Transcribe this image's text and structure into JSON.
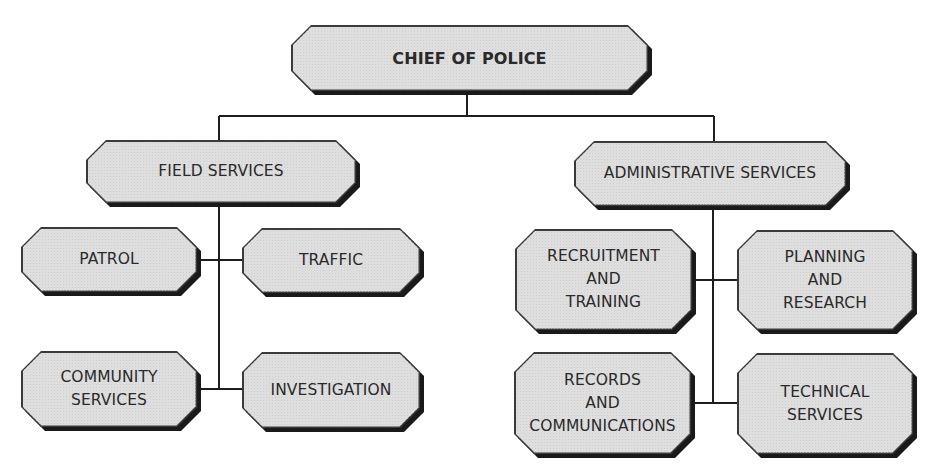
{
  "diagram": {
    "type": "org-chart",
    "root": {
      "label": "CHIEF OF POLICE",
      "children": [
        "field_services",
        "administrative_services"
      ]
    },
    "nodes": {
      "chief": {
        "lines": [
          "CHIEF OF POLICE"
        ]
      },
      "field_services": {
        "lines": [
          "FIELD SERVICES"
        ]
      },
      "administrative_services": {
        "lines": [
          "ADMINISTRATIVE SERVICES"
        ]
      },
      "patrol": {
        "lines": [
          "PATROL"
        ]
      },
      "traffic": {
        "lines": [
          "TRAFFIC"
        ]
      },
      "community_services": {
        "lines": [
          "COMMUNITY",
          "SERVICES"
        ]
      },
      "investigation": {
        "lines": [
          "INVESTIGATION"
        ]
      },
      "recruitment_training": {
        "lines": [
          "RECRUITMENT",
          "AND",
          "TRAINING"
        ]
      },
      "planning_research": {
        "lines": [
          "PLANNING",
          "AND",
          "RESEARCH"
        ]
      },
      "records_communications": {
        "lines": [
          "RECORDS",
          "AND",
          "COMMUNICATIONS"
        ]
      },
      "technical_services": {
        "lines": [
          "TECHNICAL",
          "SERVICES"
        ]
      }
    },
    "hierarchy": {
      "CHIEF OF POLICE": [
        "FIELD SERVICES",
        "ADMINISTRATIVE SERVICES"
      ],
      "FIELD SERVICES": [
        "PATROL",
        "TRAFFIC",
        "COMMUNITY SERVICES",
        "INVESTIGATION"
      ],
      "ADMINISTRATIVE SERVICES": [
        "RECRUITMENT AND TRAINING",
        "PLANNING AND RESEARCH",
        "RECORDS AND COMMUNICATIONS",
        "TECHNICAL SERVICES"
      ]
    },
    "colors": {
      "box_fill": "#dedede",
      "box_border": "#3a3a3a",
      "shadow": "#1a1a1a",
      "line": "#1e1e1e",
      "text": "#2a2a2a",
      "background": "#ffffff"
    }
  }
}
